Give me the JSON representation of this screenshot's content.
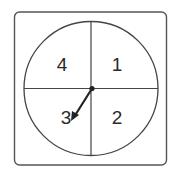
{
  "spinner": {
    "sections": [
      {
        "label": "1",
        "position": "top-right"
      },
      {
        "label": "2",
        "position": "bottom-right"
      },
      {
        "label": "3",
        "position": "bottom-left"
      },
      {
        "label": "4",
        "position": "top-left"
      }
    ],
    "pointer_section": "3",
    "colors": {
      "stroke": "#3a3a3a",
      "background": "#ffffff"
    }
  }
}
